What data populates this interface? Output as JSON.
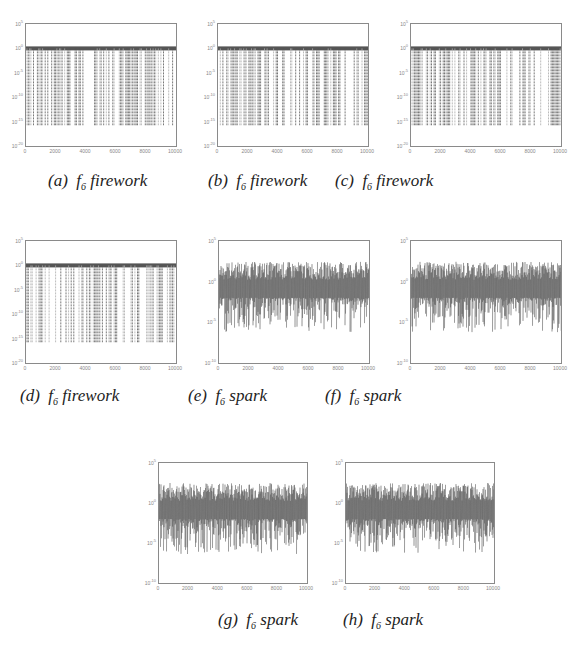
{
  "chart_data": [
    {
      "id": "a",
      "type": "line",
      "caption_label": "(a)",
      "caption_func": "f",
      "caption_sub": "6",
      "caption_word": "firework",
      "legend": "module",
      "yscale": "log",
      "yticks": [
        "10^5",
        "10^0",
        "10^-5",
        "10^-10",
        "10^-15",
        "10^-20"
      ],
      "xticks": [
        "0",
        "2000",
        "4000",
        "6000",
        "8000",
        "10000"
      ],
      "xlim": [
        0,
        10000
      ],
      "ylim": [
        "1e-20",
        "1e5"
      ],
      "pattern": "firework"
    },
    {
      "id": "b",
      "type": "line",
      "caption_label": "(b)",
      "caption_func": "f",
      "caption_sub": "6",
      "caption_word": "firework",
      "legend": "boundary",
      "yscale": "log",
      "yticks": [
        "10^5",
        "10^0",
        "10^-5",
        "10^-10",
        "10^-15",
        "10^-20"
      ],
      "xticks": [
        "0",
        "2000",
        "4000",
        "6000",
        "8000",
        "10000"
      ],
      "xlim": [
        0,
        10000
      ],
      "ylim": [
        "1e-20",
        "1e5"
      ],
      "pattern": "firework"
    },
    {
      "id": "c",
      "type": "line",
      "caption_label": "(c)",
      "caption_func": "f",
      "caption_sub": "6",
      "caption_word": "firework",
      "legend": "half",
      "yscale": "log",
      "yticks": [
        "10^5",
        "10^0",
        "10^-5",
        "10^-10",
        "10^-15",
        "10^-20"
      ],
      "xticks": [
        "0",
        "2000",
        "4000",
        "6000",
        "8000",
        "10000"
      ],
      "xlim": [
        0,
        10000
      ],
      "ylim": [
        "1e-20",
        "1e5"
      ],
      "pattern": "firework"
    },
    {
      "id": "d",
      "type": "line",
      "caption_label": "(d)",
      "caption_func": "f",
      "caption_sub": "6",
      "caption_word": "firework",
      "legend": "limit",
      "yscale": "log",
      "yticks": [
        "10^5",
        "10^0",
        "10^-5",
        "10^-10",
        "10^-15",
        "10^-20"
      ],
      "xticks": [
        "0",
        "2000",
        "4000",
        "6000",
        "8000",
        "10000"
      ],
      "xlim": [
        0,
        10000
      ],
      "ylim": [
        "1e-20",
        "1e5"
      ],
      "pattern": "firework"
    },
    {
      "id": "e",
      "type": "line",
      "caption_label": "(e)",
      "caption_func": "f",
      "caption_sub": "6",
      "caption_word": "spark",
      "legend": "module",
      "yscale": "log",
      "yticks": [
        "10^5",
        "10^0",
        "10^-5",
        "10^-10"
      ],
      "xticks": [
        "0",
        "2000",
        "4000",
        "6000",
        "8000",
        "10000"
      ],
      "xlim": [
        0,
        10000
      ],
      "ylim": [
        "1e-10",
        "1e5"
      ],
      "pattern": "spark"
    },
    {
      "id": "f",
      "type": "line",
      "caption_label": "(f)",
      "caption_func": "f",
      "caption_sub": "6",
      "caption_word": "spark",
      "legend": "boundary",
      "yscale": "log",
      "yticks": [
        "10^5",
        "10^0",
        "10^-5",
        "10^-10"
      ],
      "xticks": [
        "0",
        "2000",
        "4000",
        "6000",
        "8000",
        "10000"
      ],
      "xlim": [
        0,
        10000
      ],
      "ylim": [
        "1e-10",
        "1e5"
      ],
      "pattern": "spark"
    },
    {
      "id": "g",
      "type": "line",
      "caption_label": "(g)",
      "caption_func": "f",
      "caption_sub": "6",
      "caption_word": "spark",
      "legend": "half",
      "yscale": "log",
      "yticks": [
        "10^5",
        "10^0",
        "10^-5",
        "10^-10"
      ],
      "xticks": [
        "0",
        "2000",
        "4000",
        "6000",
        "8000",
        "10000"
      ],
      "xlim": [
        0,
        10000
      ],
      "ylim": [
        "1e-10",
        "1e5"
      ],
      "pattern": "spark"
    },
    {
      "id": "h",
      "type": "line",
      "caption_label": "(h)",
      "caption_func": "f",
      "caption_sub": "6",
      "caption_word": "spark",
      "legend": "limit",
      "yscale": "log",
      "yticks": [
        "10^5",
        "10^0",
        "10^-5",
        "10^-10"
      ],
      "xticks": [
        "0",
        "2000",
        "4000",
        "6000",
        "8000",
        "10000"
      ],
      "xlim": [
        0,
        10000
      ],
      "ylim": [
        "1e-10",
        "1e5"
      ],
      "pattern": "spark"
    }
  ],
  "layout": {
    "panels": [
      {
        "x": 25,
        "y": 23,
        "w": 150,
        "h": 122,
        "cx": 48,
        "cy": 183
      },
      {
        "x": 217,
        "y": 23,
        "w": 150,
        "h": 122,
        "cx": 208,
        "cy": 183
      },
      {
        "x": 410,
        "y": 23,
        "w": 150,
        "h": 122,
        "cx": 335,
        "cy": 183
      },
      {
        "x": 25,
        "y": 240,
        "w": 150,
        "h": 122,
        "cx": 20,
        "cy": 398
      },
      {
        "x": 218,
        "y": 240,
        "w": 150,
        "h": 122,
        "cx": 188,
        "cy": 398
      },
      {
        "x": 410,
        "y": 240,
        "w": 150,
        "h": 122,
        "cx": 325,
        "cy": 398
      },
      {
        "x": 158,
        "y": 462,
        "w": 148,
        "h": 120,
        "cx": 218,
        "cy": 622
      },
      {
        "x": 345,
        "y": 462,
        "w": 148,
        "h": 120,
        "cx": 343,
        "cy": 622
      }
    ],
    "colors": {
      "line_dark": "#555555",
      "line_light": "#aaaaaa",
      "axis": "#8a8a8a"
    }
  }
}
